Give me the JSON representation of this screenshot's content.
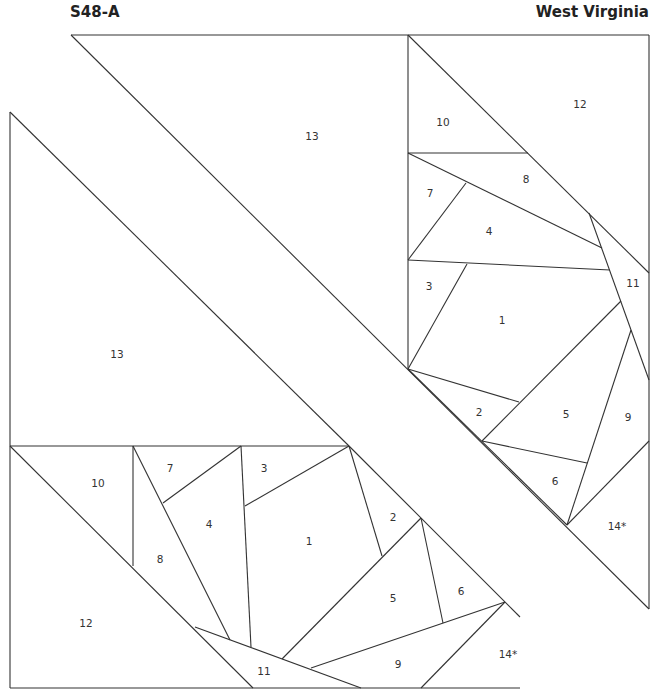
{
  "header": {
    "pattern_id": "S48-A",
    "pattern_name": "West Virginia"
  },
  "upper_block": {
    "labels": [
      {
        "id": "13",
        "x": 312,
        "y": 140
      },
      {
        "id": "10",
        "x": 443,
        "y": 126
      },
      {
        "id": "12",
        "x": 580,
        "y": 108
      },
      {
        "id": "8",
        "x": 526,
        "y": 183
      },
      {
        "id": "7",
        "x": 430,
        "y": 197
      },
      {
        "id": "4",
        "x": 489,
        "y": 235
      },
      {
        "id": "11",
        "x": 633,
        "y": 287
      },
      {
        "id": "3",
        "x": 429,
        "y": 290
      },
      {
        "id": "1",
        "x": 502,
        "y": 324
      },
      {
        "id": "2",
        "x": 479,
        "y": 416
      },
      {
        "id": "5",
        "x": 566,
        "y": 418
      },
      {
        "id": "9",
        "x": 628,
        "y": 421
      },
      {
        "id": "6",
        "x": 555,
        "y": 485
      },
      {
        "id": "14*",
        "x": 617,
        "y": 530
      }
    ]
  },
  "lower_block": {
    "labels": [
      {
        "id": "13",
        "x": 117,
        "y": 358
      },
      {
        "id": "10",
        "x": 98,
        "y": 487
      },
      {
        "id": "7",
        "x": 170,
        "y": 472
      },
      {
        "id": "3",
        "x": 264,
        "y": 472
      },
      {
        "id": "4",
        "x": 209,
        "y": 528
      },
      {
        "id": "2",
        "x": 393,
        "y": 521
      },
      {
        "id": "1",
        "x": 309,
        "y": 545
      },
      {
        "id": "8",
        "x": 160,
        "y": 563
      },
      {
        "id": "5",
        "x": 393,
        "y": 602
      },
      {
        "id": "6",
        "x": 461,
        "y": 595
      },
      {
        "id": "12",
        "x": 86,
        "y": 627
      },
      {
        "id": "14*",
        "x": 508,
        "y": 658
      },
      {
        "id": "9",
        "x": 398,
        "y": 668
      },
      {
        "id": "11",
        "x": 264,
        "y": 675
      }
    ]
  }
}
